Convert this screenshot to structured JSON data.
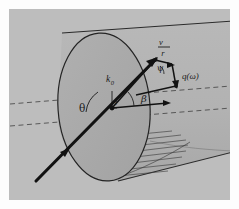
{
  "figure": {
    "caption": "",
    "background_color": "#fdfdfd",
    "panel_color": "#bdbdbd",
    "cylinder_body_color": "#b4b4b4",
    "cylinder_cap_color": "#a9a9a9",
    "line_color": "#1b1b1b",
    "dashed_color": "#4a4a4a"
  },
  "labels": {
    "theta": "θ",
    "beta": "β",
    "psi": "ψ",
    "k_zero_base": "k",
    "k_zero_sub": "0",
    "radius": "r",
    "velocity_numerator": "v",
    "velocity_denominator": "r",
    "scattering_vector_base": "q",
    "scattering_vector_arg": "(ω)"
  },
  "annotations": {
    "incident_ray": "incident-beam-arrow",
    "axis_line": "cylinder-axis-dashed-line",
    "reference_line": "reference-dashed-line",
    "flow_profile": "flow-profile-hatching",
    "vector_triangle": "velocity-vector-triangle"
  }
}
